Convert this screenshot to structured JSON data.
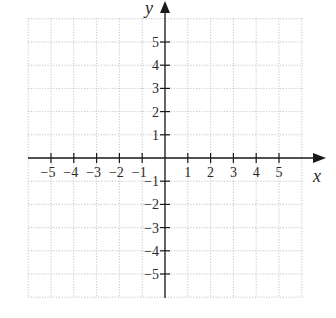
{
  "chart_data": {
    "type": "scatter",
    "title": "",
    "xlabel": "x",
    "ylabel": "y",
    "xlim": [
      -6,
      6
    ],
    "ylim": [
      -6,
      6
    ],
    "grid": true,
    "x_ticks": [
      -5,
      -4,
      -3,
      -2,
      -1,
      1,
      2,
      3,
      4,
      5
    ],
    "y_ticks": [
      -5,
      -4,
      -3,
      -2,
      -1,
      1,
      2,
      3,
      4,
      5
    ],
    "x_tick_labels": [
      "−5",
      "−4",
      "−3",
      "−2",
      "−1",
      "1",
      "2",
      "3",
      "4",
      "5"
    ],
    "y_tick_labels": [
      "−5",
      "−4",
      "−3",
      "−2",
      "−1",
      "1",
      "2",
      "3",
      "4",
      "5"
    ],
    "series": [],
    "colors": {
      "axis": "#1a1a1a",
      "grid": "#b8b8b8",
      "text": "#2a2a2a"
    }
  },
  "labels": {
    "x_axis": "x",
    "y_axis": "y"
  }
}
